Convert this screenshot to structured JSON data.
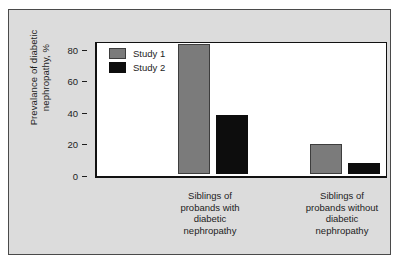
{
  "chart_data": {
    "type": "bar",
    "title": "",
    "subtitle": "",
    "xlabel": "",
    "ylabel": "Prevalance of diabetic\nnephropathy, %",
    "categories": [
      "Siblings of\nprobands with\ndiabetic\nnephropathy",
      "Siblings of\nprobands without\ndiabetic\nnephropathy"
    ],
    "series": [
      {
        "name": "Study 1",
        "color": "#7b7b7b",
        "values": [
          81,
          18
        ]
      },
      {
        "name": "Study 2",
        "color": "#0d0d0d",
        "values": [
          36,
          6
        ]
      }
    ],
    "ylim": [
      0,
      85
    ],
    "yticks": [
      0,
      20,
      40,
      60,
      80
    ],
    "ytick_labels": [
      "0",
      "20",
      "40",
      "60",
      "80"
    ],
    "grid": false,
    "legend_position": "top-left"
  },
  "legend": {
    "entries": [
      {
        "label": "Study 1"
      },
      {
        "label": "Study 2"
      }
    ]
  },
  "figure": {
    "background_color": "#dcdcdc",
    "plot_background_color": "#ffffff",
    "axis_color": "#111111"
  }
}
